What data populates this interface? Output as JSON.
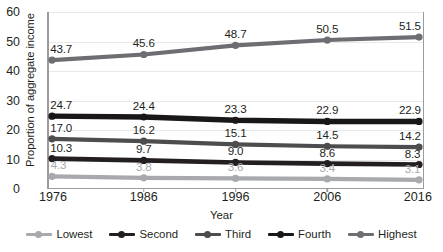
{
  "chart_data": {
    "type": "line",
    "title": "",
    "xlabel": "Year",
    "ylabel": "Proportion of aggregate income",
    "x": [
      "1976",
      "1986",
      "1996",
      "2006",
      "2016"
    ],
    "categories": [
      "1976",
      "1986",
      "1996",
      "2006",
      "2016"
    ],
    "ylim": [
      0,
      60
    ],
    "yticks": [
      "0",
      "10",
      "20",
      "30",
      "40",
      "50",
      "60"
    ],
    "grid": true,
    "legend_position": "bottom",
    "series": [
      {
        "name": "Lowest",
        "color": "#a7a9ac",
        "values": [
          4.3,
          3.8,
          3.6,
          3.4,
          3.1
        ],
        "labels": [
          "4.3",
          "3.8",
          "3.6",
          "3.4",
          "3.1"
        ]
      },
      {
        "name": "Second",
        "color": "#231f20",
        "values": [
          10.3,
          9.7,
          9.0,
          8.6,
          8.3
        ],
        "labels": [
          "10.3",
          "9.7",
          "9.0",
          "8.6",
          "8.3"
        ]
      },
      {
        "name": "Third",
        "color": "#4d4d4f",
        "values": [
          17.0,
          16.2,
          15.1,
          14.5,
          14.2
        ],
        "labels": [
          "17.0",
          "16.2",
          "15.1",
          "14.5",
          "14.2"
        ]
      },
      {
        "name": "Fourth",
        "color": "#1a1718",
        "values": [
          24.7,
          24.4,
          23.3,
          22.9,
          22.9
        ],
        "labels": [
          "24.7",
          "24.4",
          "23.3",
          "22.9",
          "22.9"
        ]
      },
      {
        "name": "Highest",
        "color": "#6d6e71",
        "values": [
          43.7,
          45.6,
          48.7,
          50.5,
          51.5
        ],
        "labels": [
          "43.7",
          "45.6",
          "48.7",
          "50.5",
          "51.5"
        ]
      }
    ]
  },
  "axis": {
    "y_title": "Proportion of aggregate income",
    "x_title": "Year"
  }
}
